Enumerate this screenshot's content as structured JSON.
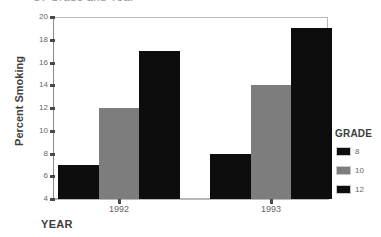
{
  "figure": {
    "title_fragment": "by Grade and Year",
    "xaxis_title": "YEAR",
    "yaxis_title": "Percent Smoking",
    "legend_title": "GRADE"
  },
  "chart_data": {
    "type": "bar",
    "title": "",
    "xlabel": "YEAR",
    "ylabel": "Percent Smoking",
    "categories": [
      "1992",
      "1993"
    ],
    "series": [
      {
        "name": "8",
        "values": [
          7,
          8
        ],
        "color": "#0d0d0d"
      },
      {
        "name": "10",
        "values": [
          12,
          14
        ],
        "color": "#7d7d7d"
      },
      {
        "name": "12",
        "values": [
          17,
          19
        ],
        "color": "#0d0d0d"
      }
    ],
    "ylim": [
      4,
      20
    ],
    "yticks": [
      "20",
      "18",
      "16",
      "14",
      "12",
      "10",
      "8",
      "6",
      "4"
    ],
    "grid": false,
    "legend_position": "right"
  }
}
